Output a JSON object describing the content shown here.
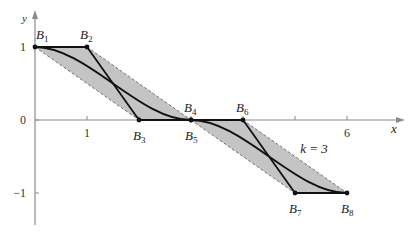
{
  "diagram": {
    "axes": {
      "x_label": "x",
      "y_label": "y",
      "x_ticks": [
        {
          "value": 1,
          "label": "1"
        },
        {
          "value": 2,
          "label": ""
        },
        {
          "value": 3,
          "label": ""
        },
        {
          "value": 4,
          "label": ""
        },
        {
          "value": 5,
          "label": ""
        },
        {
          "value": 6,
          "label": "6"
        }
      ],
      "y_ticks": [
        {
          "value": 1,
          "label": "1"
        },
        {
          "value": 0,
          "label": "0"
        },
        {
          "value": -1,
          "label": "−1"
        }
      ],
      "x_range": [
        0,
        7
      ],
      "y_range": [
        -1.45,
        1.5
      ]
    },
    "segments": [
      {
        "name": "first-bezier",
        "control_points": [
          {
            "id": "B1",
            "x": 0,
            "y": 1
          },
          {
            "id": "B2",
            "x": 1,
            "y": 1
          },
          {
            "id": "B3",
            "x": 2,
            "y": 0
          },
          {
            "id": "B4",
            "x": 3,
            "y": 0
          }
        ]
      },
      {
        "name": "second-bezier",
        "control_points": [
          {
            "id": "B5",
            "x": 3,
            "y": 0
          },
          {
            "id": "B6",
            "x": 4,
            "y": 0
          },
          {
            "id": "B7",
            "x": 5,
            "y": -1
          },
          {
            "id": "B8",
            "x": 6,
            "y": -1
          }
        ]
      }
    ],
    "point_labels": [
      {
        "base": "B",
        "sub": "1",
        "pos": "above-right"
      },
      {
        "base": "B",
        "sub": "2",
        "pos": "above"
      },
      {
        "base": "B",
        "sub": "3",
        "pos": "below"
      },
      {
        "base": "B",
        "sub": "4",
        "pos": "above"
      },
      {
        "base": "B",
        "sub": "5",
        "pos": "below"
      },
      {
        "base": "B",
        "sub": "6",
        "pos": "above"
      },
      {
        "base": "B",
        "sub": "7",
        "pos": "below"
      },
      {
        "base": "B",
        "sub": "8",
        "pos": "below"
      }
    ],
    "annotation": {
      "text": "k = 3",
      "x": 5.1,
      "y": -0.45
    },
    "colors": {
      "hull_fill": "#c4c4c4",
      "curve": "#111111",
      "axis": "#8a8a8a"
    }
  }
}
